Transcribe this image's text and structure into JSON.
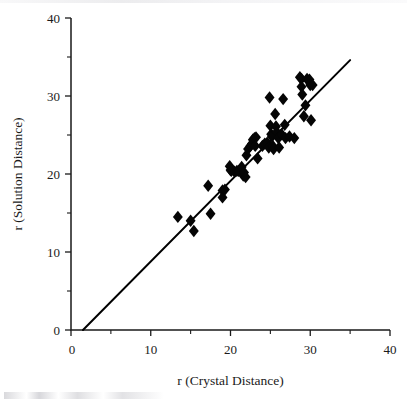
{
  "figure": {
    "background_color": "#ffffff",
    "ink_color": "#1a1a1a"
  },
  "chart_data": {
    "type": "scatter",
    "title": "",
    "xlabel": "r (Crystal Distance)",
    "ylabel": "r (Solution Distance)",
    "xlim": [
      0,
      40
    ],
    "ylim": [
      0,
      40
    ],
    "grid": false,
    "legend": null,
    "x_major_ticks": [
      0,
      10,
      20,
      30,
      40
    ],
    "x_minor_ticks": [
      5,
      15,
      25,
      35
    ],
    "x_tick_labels": [
      "0",
      "10",
      "20",
      "30",
      "40"
    ],
    "y_major_ticks": [
      0,
      10,
      20,
      30,
      40
    ],
    "y_minor_ticks": [
      5,
      15,
      25,
      35
    ],
    "y_tick_labels": [
      "0",
      "10",
      "20",
      "30",
      "40"
    ],
    "origin_label": "0",
    "marker": "diamond",
    "marker_color": "#050505",
    "marker_size": 6.2,
    "reference_line": {
      "label": "y = x identity line",
      "color": "#000000",
      "width": 2,
      "x_start": 1.5,
      "y_start": 0.0,
      "x_end": 35.0,
      "y_end": 34.6
    },
    "points": [
      {
        "x": 13.4,
        "y": 14.5
      },
      {
        "x": 15.0,
        "y": 14.0
      },
      {
        "x": 15.4,
        "y": 12.7
      },
      {
        "x": 17.2,
        "y": 18.5
      },
      {
        "x": 17.5,
        "y": 14.9
      },
      {
        "x": 19.0,
        "y": 17.9
      },
      {
        "x": 19.0,
        "y": 17.0
      },
      {
        "x": 19.3,
        "y": 18.0
      },
      {
        "x": 19.9,
        "y": 21.0
      },
      {
        "x": 20.0,
        "y": 20.5
      },
      {
        "x": 20.1,
        "y": 20.4
      },
      {
        "x": 20.5,
        "y": 20.3
      },
      {
        "x": 20.8,
        "y": 20.4
      },
      {
        "x": 21.0,
        "y": 20.4
      },
      {
        "x": 21.4,
        "y": 20.9
      },
      {
        "x": 21.6,
        "y": 19.8
      },
      {
        "x": 21.7,
        "y": 20.2
      },
      {
        "x": 21.9,
        "y": 19.6
      },
      {
        "x": 22.0,
        "y": 22.4
      },
      {
        "x": 22.2,
        "y": 23.2
      },
      {
        "x": 22.5,
        "y": 23.6
      },
      {
        "x": 22.7,
        "y": 23.9
      },
      {
        "x": 22.8,
        "y": 24.4
      },
      {
        "x": 23.0,
        "y": 24.6
      },
      {
        "x": 23.2,
        "y": 24.7
      },
      {
        "x": 23.1,
        "y": 23.6
      },
      {
        "x": 23.4,
        "y": 22.0
      },
      {
        "x": 24.0,
        "y": 23.6
      },
      {
        "x": 24.3,
        "y": 23.9
      },
      {
        "x": 24.6,
        "y": 24.0
      },
      {
        "x": 24.8,
        "y": 23.4
      },
      {
        "x": 24.9,
        "y": 29.8
      },
      {
        "x": 25.0,
        "y": 26.2
      },
      {
        "x": 25.1,
        "y": 25.1
      },
      {
        "x": 25.2,
        "y": 24.8
      },
      {
        "x": 25.3,
        "y": 23.6
      },
      {
        "x": 25.4,
        "y": 23.2
      },
      {
        "x": 25.6,
        "y": 27.7
      },
      {
        "x": 25.7,
        "y": 26.1
      },
      {
        "x": 25.8,
        "y": 25.4
      },
      {
        "x": 26.0,
        "y": 24.6
      },
      {
        "x": 26.1,
        "y": 23.4
      },
      {
        "x": 26.4,
        "y": 25.1
      },
      {
        "x": 26.6,
        "y": 29.6
      },
      {
        "x": 26.8,
        "y": 26.3
      },
      {
        "x": 26.9,
        "y": 24.6
      },
      {
        "x": 27.4,
        "y": 24.8
      },
      {
        "x": 28.0,
        "y": 24.6
      },
      {
        "x": 28.7,
        "y": 32.4
      },
      {
        "x": 28.9,
        "y": 32.2
      },
      {
        "x": 28.9,
        "y": 31.2
      },
      {
        "x": 29.0,
        "y": 30.2
      },
      {
        "x": 29.2,
        "y": 27.4
      },
      {
        "x": 29.4,
        "y": 28.8
      },
      {
        "x": 29.6,
        "y": 32.2
      },
      {
        "x": 29.8,
        "y": 31.9
      },
      {
        "x": 29.9,
        "y": 32.1
      },
      {
        "x": 30.0,
        "y": 31.4
      },
      {
        "x": 30.1,
        "y": 26.9
      },
      {
        "x": 30.3,
        "y": 31.4
      }
    ]
  }
}
